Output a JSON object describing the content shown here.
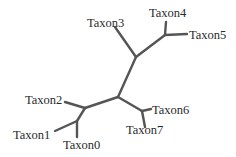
{
  "diagram": {
    "type": "unrooted phylogenetic tree",
    "branch_color": "#555555",
    "label_color": "#2a2a2a",
    "nodes": {
      "n_top": {
        "x": 136,
        "y": 57
      },
      "n_45": {
        "x": 165,
        "y": 35
      },
      "n_mid": {
        "x": 118,
        "y": 97
      },
      "n_left": {
        "x": 85,
        "y": 108
      },
      "n_01": {
        "x": 77,
        "y": 121
      },
      "n_67": {
        "x": 142,
        "y": 111
      }
    },
    "taxa": [
      {
        "id": "t0",
        "label": "Taxon0",
        "tip": {
          "x": 77,
          "y": 137
        },
        "label_pos": {
          "x": 63,
          "y": 149
        }
      },
      {
        "id": "t1",
        "label": "Taxon1",
        "tip": {
          "x": 55,
          "y": 131
        },
        "label_pos": {
          "x": 13,
          "y": 139
        }
      },
      {
        "id": "t2",
        "label": "Taxon2",
        "tip": {
          "x": 65,
          "y": 102
        },
        "label_pos": {
          "x": 25,
          "y": 104
        }
      },
      {
        "id": "t3",
        "label": "Taxon3",
        "tip": {
          "x": 115,
          "y": 27
        },
        "label_pos": {
          "x": 87,
          "y": 27
        }
      },
      {
        "id": "t4",
        "label": "Taxon4",
        "tip": {
          "x": 166,
          "y": 22
        },
        "label_pos": {
          "x": 149,
          "y": 17
        }
      },
      {
        "id": "t5",
        "label": "Taxon5",
        "tip": {
          "x": 187,
          "y": 34
        },
        "label_pos": {
          "x": 189,
          "y": 39
        }
      },
      {
        "id": "t6",
        "label": "Taxon6",
        "tip": {
          "x": 151,
          "y": 109
        },
        "label_pos": {
          "x": 152,
          "y": 114
        }
      },
      {
        "id": "t7",
        "label": "Taxon7",
        "tip": {
          "x": 145,
          "y": 127
        },
        "label_pos": {
          "x": 126,
          "y": 134
        }
      }
    ],
    "edges": [
      [
        "n_mid",
        "n_top"
      ],
      [
        "n_top",
        "t3"
      ],
      [
        "n_top",
        "n_45"
      ],
      [
        "n_45",
        "t4"
      ],
      [
        "n_45",
        "t5"
      ],
      [
        "n_mid",
        "n_left"
      ],
      [
        "n_left",
        "t2"
      ],
      [
        "n_left",
        "n_01"
      ],
      [
        "n_01",
        "t1"
      ],
      [
        "n_01",
        "t0"
      ],
      [
        "n_mid",
        "n_67"
      ],
      [
        "n_67",
        "t6"
      ],
      [
        "n_67",
        "t7"
      ]
    ]
  }
}
